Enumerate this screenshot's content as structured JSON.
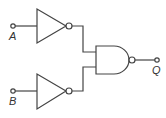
{
  "diagram": {
    "type": "logic-circuit",
    "inputs": [
      {
        "id": "A",
        "label": "A"
      },
      {
        "id": "B",
        "label": "B"
      }
    ],
    "output": {
      "id": "Q",
      "label": "Q"
    },
    "gates": [
      {
        "id": "not1",
        "type": "NOT",
        "input": "A"
      },
      {
        "id": "not2",
        "type": "NOT",
        "input": "B"
      },
      {
        "id": "nand1",
        "type": "NAND",
        "inputs": [
          "not1",
          "not2"
        ],
        "output": "Q"
      }
    ],
    "colors": {
      "stroke": "#444444",
      "background": "#ffffff"
    }
  }
}
